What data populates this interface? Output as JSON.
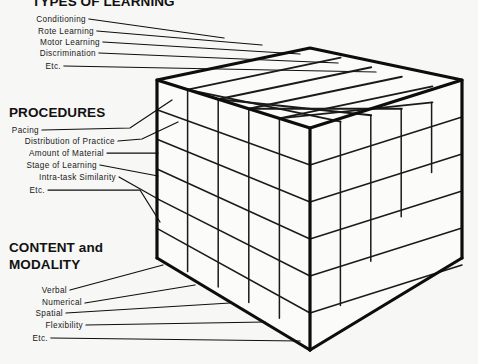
{
  "figure": {
    "background_color": "#f7f7f5",
    "ink_color": "#111111",
    "diagram_kind": "three-dimensional-cube-taxonomy"
  },
  "axes": [
    {
      "id": "types-of-learning",
      "heading": "TYPES of LEARNING",
      "heading_display": "TYPES OF LEARNING",
      "position": "top",
      "items": [
        "Conditioning",
        "Rote Learning",
        "Motor Learning",
        "Discrimination",
        "Etc."
      ]
    },
    {
      "id": "procedures",
      "heading": "PROCEDURES",
      "position": "left",
      "items": [
        "Pacing",
        "Distribution of Practice",
        "Amount of Material",
        "Stage of Learning",
        "Intra-task Similarity",
        "Etc."
      ]
    },
    {
      "id": "content-and-modality",
      "heading_line1": "CONTENT and",
      "heading_line2": "MODALITY",
      "position": "bottom",
      "items": [
        "Verbal",
        "Numerical",
        "Spatial",
        "Flexibility",
        "Etc."
      ]
    }
  ],
  "cube": {
    "divisions_top_rows": 5,
    "divisions_top_cols": 5,
    "divisions_front_rows": 6,
    "divisions_front_cols": 5,
    "edge_color": "#0d0d0d",
    "grid_color": "#1a1a1a",
    "face_color": "#fbfbf9"
  }
}
